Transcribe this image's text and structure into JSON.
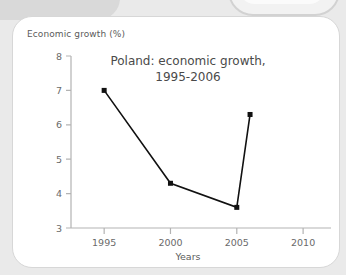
{
  "card": {
    "y_axis_label": "Economic growth (%)"
  },
  "decor": {
    "block_topleft": "grey-rounded-block",
    "pill_topright": "grey-rounded-pill"
  },
  "colors": {
    "background": "#eaeaea",
    "card": "#ffffff",
    "card_border": "#d7d7d7",
    "axis": "#b3b3b3",
    "series": "#111111",
    "text": "#5b5b5b",
    "title_text": "#4a4a4a"
  },
  "chart_data": {
    "type": "line",
    "title": "Poland: economic growth,",
    "title_line2": "1995-2006",
    "xlabel": "Years",
    "ylabel": "Economic growth (%)",
    "x": [
      1995,
      2000,
      2005,
      2006
    ],
    "values": [
      7.0,
      4.3,
      3.6,
      6.3
    ],
    "series": [
      {
        "name": "Economic growth (%)",
        "values": [
          7.0,
          4.3,
          3.6,
          6.3
        ]
      }
    ],
    "xlim": [
      1992.5,
      2011.5
    ],
    "ylim": [
      3,
      8
    ],
    "xticks": [
      1995,
      2000,
      2005,
      2010
    ],
    "xtick_labels": [
      "1995",
      "2000",
      "2005",
      "2010"
    ],
    "yticks": [
      3,
      4,
      5,
      6,
      7,
      8
    ],
    "ytick_labels": [
      "3",
      "4",
      "5",
      "6",
      "7",
      "8"
    ],
    "grid": false,
    "legend": false,
    "marker": "square"
  }
}
